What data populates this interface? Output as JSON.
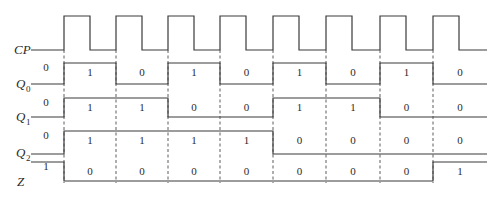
{
  "diagram": {
    "clock": {
      "label": "CP",
      "rising_edges_x": [
        64,
        116,
        168,
        220,
        273,
        326,
        380,
        433
      ],
      "pulse_width": 26,
      "end_x": 487
    },
    "signals": [
      {
        "name": "Q",
        "subscript": "0",
        "initial": "0",
        "values": [
          "1",
          "0",
          "1",
          "0",
          "1",
          "0",
          "1",
          "0"
        ]
      },
      {
        "name": "Q",
        "subscript": "1",
        "initial": "0",
        "values": [
          "1",
          "1",
          "0",
          "0",
          "1",
          "1",
          "0",
          "0"
        ]
      },
      {
        "name": "Q",
        "subscript": "2",
        "initial": "0",
        "values": [
          "1",
          "1",
          "1",
          "1",
          "0",
          "0",
          "0",
          "0"
        ]
      },
      {
        "name": "Z",
        "subscript": "",
        "initial": "1",
        "values": [
          "0",
          "0",
          "0",
          "0",
          "0",
          "0",
          "0",
          "1"
        ]
      }
    ],
    "colors": {
      "line": "#3a3a3a",
      "text": "#2a2a2a",
      "background": "#ffffff"
    }
  }
}
